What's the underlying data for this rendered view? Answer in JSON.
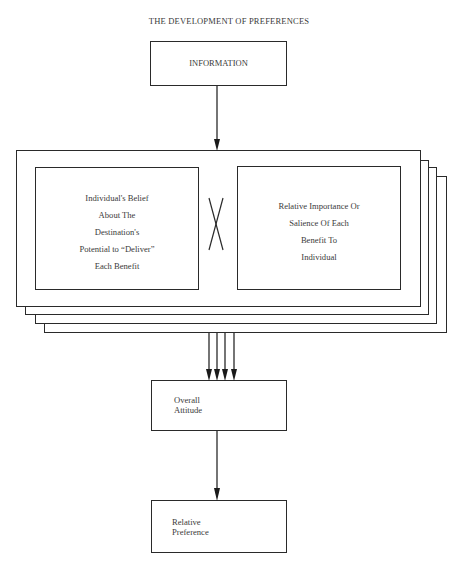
{
  "title": "THE DEVELOPMENT OF PREFERENCES",
  "nodes": {
    "information": {
      "label": "INFORMATION"
    },
    "belief": {
      "lines": [
        "Individual's Belief",
        "About The",
        "Destination's",
        "Potential to “Deliver”",
        "Each Benefit"
      ]
    },
    "multiply_symbol": "X",
    "importance": {
      "lines": [
        "Relative Importance Or",
        "Salience Of Each",
        "Benefit To",
        "Individual"
      ]
    },
    "overall_attitude": {
      "lines": [
        "Overall",
        "Attitude"
      ]
    },
    "relative_preference": {
      "lines": [
        "Relative",
        "Preference"
      ]
    }
  },
  "stack": {
    "layers": 4,
    "note": "one layer per benefit"
  },
  "edges": [
    {
      "from": "information",
      "to": "benefit-stack"
    },
    {
      "from": "benefit-stack",
      "to": "overall_attitude",
      "count": 4
    },
    {
      "from": "overall_attitude",
      "to": "relative_preference"
    }
  ],
  "colors": {
    "line": "#2a2a2a",
    "text": "#3a3a3a",
    "background": "#ffffff"
  }
}
